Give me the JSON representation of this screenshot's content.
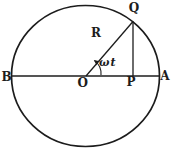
{
  "diagram": {
    "labels": {
      "q": "Q",
      "r": "R",
      "angle": "ωt",
      "b": "B",
      "o": "O",
      "p": "P",
      "a": "A"
    },
    "colors": {
      "stroke": "#1c1c1c",
      "background": "#ffffff"
    }
  }
}
